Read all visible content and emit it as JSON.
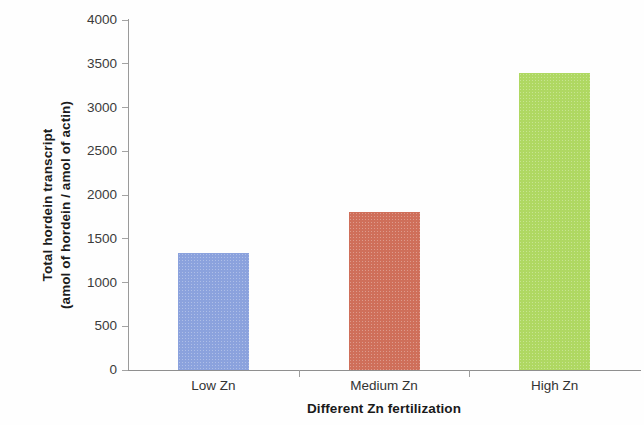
{
  "chart_data": {
    "type": "bar",
    "title": "",
    "subtitle": "",
    "xlabel": "Different Zn fertilization",
    "ylabel": "Total hordein transcript (amol of hordein / amol of actin)",
    "ylabel_lines": [
      "Total hordein transcript",
      "(amol of hordein / amol of actin)"
    ],
    "categories": [
      "Low Zn",
      "Medium Zn",
      "High Zn"
    ],
    "values": [
      1340,
      1810,
      3400
    ],
    "series": [
      {
        "name": "Total hordein transcript",
        "values": [
          1340,
          1810,
          3400
        ]
      }
    ],
    "bar_colors": [
      "#8BA2DD",
      "#CF6F5A",
      "#AFD862"
    ],
    "ylim": [
      0,
      4000
    ],
    "ytick_labels": [
      "0",
      "500",
      "1000",
      "1500",
      "2000",
      "2500",
      "3000",
      "3500",
      "4000"
    ],
    "ytick_values": [
      0,
      500,
      1000,
      1500,
      2000,
      2500,
      3000,
      3500,
      4000
    ],
    "grid": false,
    "legend": "none",
    "legend_position": "none",
    "annotations": []
  },
  "axes": {
    "y_title_line1": "Total hordein transcript",
    "y_title_line2": "(amol of hordein / amol of actin)",
    "x_title": "Different Zn fertilization"
  },
  "colors": {
    "background": "#FEFEFE",
    "axis": "#9A9A9A",
    "tick_label": "#3B3B3B",
    "title_text": "#1A1A1A",
    "bar_low_zn": "#8BA2DD",
    "bar_medium_zn": "#CF6F5A",
    "bar_high_zn": "#AFD862"
  }
}
